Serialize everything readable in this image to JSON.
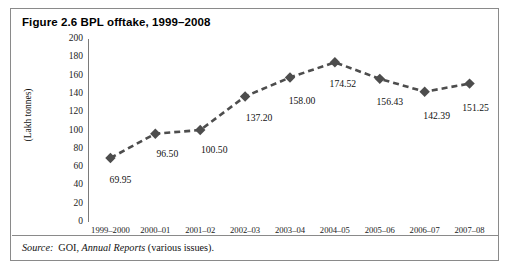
{
  "figure": {
    "title": "Figure 2.6 BPL offtake, 1999–2008",
    "source_label": "Source:",
    "source_org": "GOI,",
    "source_publication": "Annual Reports",
    "source_suffix": "(various issues)."
  },
  "colors": {
    "border": "#8a8a8a",
    "axis": "#7a7a7a",
    "series": "#4d4d4d",
    "text": "#111111",
    "background": "#ffffff"
  },
  "chart_data": {
    "type": "line",
    "title": "Figure 2.6 BPL offtake, 1999–2008",
    "xlabel": "",
    "ylabel": "(Lakh tonnes)",
    "ylim": [
      0,
      200
    ],
    "yticks": [
      0,
      20,
      40,
      60,
      80,
      100,
      120,
      140,
      160,
      180,
      200
    ],
    "ytick_labels": [
      "0",
      "20",
      "40",
      "60",
      "80",
      "100",
      "120",
      "140",
      "160",
      "180",
      "200"
    ],
    "grid": false,
    "legend": null,
    "marker": "diamond",
    "linestyle": "dashed",
    "categories": [
      "1999–2000",
      "2000–01",
      "2001–02",
      "2002–03",
      "2003–04",
      "2004–05",
      "2005–06",
      "2006–07",
      "2007–08"
    ],
    "values": [
      69.95,
      96.5,
      100.5,
      137.2,
      158.0,
      174.52,
      156.43,
      142.39,
      151.25
    ],
    "data_labels": [
      "69.95",
      "96.50",
      "100.50",
      "137.20",
      "158.00",
      "174.52",
      "156.43",
      "142.39",
      "151.25"
    ]
  }
}
